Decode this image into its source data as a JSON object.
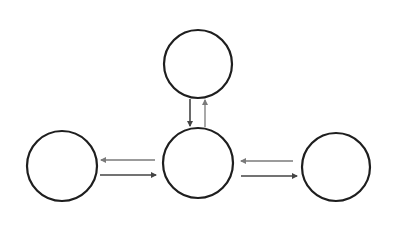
{
  "diagram": {
    "type": "node-link",
    "background": "#ffffff",
    "nodes": [
      {
        "id": "top",
        "label": "",
        "cx": 198,
        "cy": 64,
        "r": 34
      },
      {
        "id": "center",
        "label": "",
        "cx": 198,
        "cy": 163,
        "r": 35
      },
      {
        "id": "left",
        "label": "",
        "cx": 62,
        "cy": 166,
        "r": 35
      },
      {
        "id": "right",
        "label": "",
        "cx": 336,
        "cy": 167,
        "r": 34
      }
    ],
    "edges": [
      {
        "from": "top",
        "to": "center",
        "label": ""
      },
      {
        "from": "center",
        "to": "top",
        "label": ""
      },
      {
        "from": "center",
        "to": "left",
        "label": ""
      },
      {
        "from": "left",
        "to": "center",
        "label": ""
      },
      {
        "from": "right",
        "to": "center",
        "label": ""
      },
      {
        "from": "center",
        "to": "right",
        "label": ""
      }
    ],
    "colors": {
      "node_stroke": "#1e1e1e",
      "edge_dark": "#444444",
      "edge_light": "#7a7a7a"
    }
  }
}
